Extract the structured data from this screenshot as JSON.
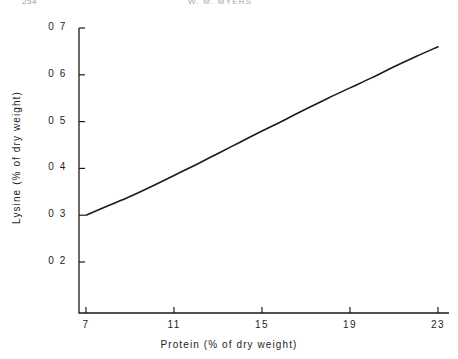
{
  "header": {
    "folio": "254",
    "running_title": "W. M. MYERS"
  },
  "chart_data": {
    "type": "line",
    "title": "",
    "xlabel": "Protein (% of dry weight)",
    "ylabel": "Lysine (% of dry weight)",
    "xlim": [
      5,
      23
    ],
    "ylim": [
      0.15,
      0.7
    ],
    "grid": false,
    "legend": "none",
    "xticks": [
      "7",
      "11",
      "15",
      "19",
      "23"
    ],
    "xtick_values": [
      7,
      11,
      15,
      19,
      23
    ],
    "yticks": [
      "0 2",
      "0 3",
      "0 4",
      "0 5",
      "0 6",
      "0 7"
    ],
    "ytick_values": [
      0.2,
      0.3,
      0.4,
      0.5,
      0.6,
      0.7
    ],
    "series": [
      {
        "name": "Lysine vs protein",
        "x": [
          7,
          8,
          9,
          10,
          11,
          12,
          13,
          14,
          15,
          16,
          17,
          18,
          19,
          20,
          21,
          22,
          23
        ],
        "values": [
          0.3,
          0.32,
          0.34,
          0.362,
          0.385,
          0.408,
          0.432,
          0.456,
          0.48,
          0.503,
          0.527,
          0.55,
          0.572,
          0.594,
          0.617,
          0.639,
          0.66
        ]
      }
    ],
    "line_color": "#1a1a1a",
    "line_width": 1.6,
    "axis_color": "#1a1a1a"
  }
}
